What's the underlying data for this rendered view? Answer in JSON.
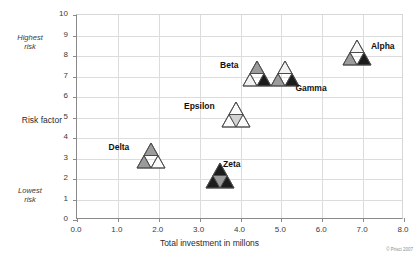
{
  "chart_data": {
    "type": "scatter",
    "title": "",
    "xlabel": "Total investment in millons",
    "ylabel": "Risk factor",
    "xlim": [
      0,
      8
    ],
    "ylim": [
      0,
      10
    ],
    "grid": true,
    "legend": "none",
    "x_ticks": [
      "0.0",
      "1.0",
      "2.0",
      "3.0",
      "4.0",
      "5.0",
      "6.0",
      "7.0",
      "8.0"
    ],
    "y_ticks": [
      "0",
      "1",
      "2",
      "3",
      "4",
      "5",
      "6",
      "7",
      "8",
      "9",
      "10"
    ],
    "y_annotations": {
      "high_line1": "Highest",
      "high_line2": "risk",
      "low_line1": "Lowest",
      "low_line2": "risk"
    },
    "points": [
      {
        "name": "Alpha",
        "x": 6.85,
        "y": 8.0,
        "label_side": "right",
        "shades": {
          "top": "#f6f6f6",
          "left": "#9b9b9b",
          "right": "#1c1c1c"
        }
      },
      {
        "name": "Beta",
        "x": 4.4,
        "y": 7.0,
        "label_side": "left",
        "shades": {
          "top": "#9b9b9b",
          "left": "#f2f2f2",
          "right": "#1c1c1c"
        }
      },
      {
        "name": "Gamma",
        "x": 5.1,
        "y": 7.0,
        "label_side": "rightlow",
        "shades": {
          "top": "#f2f2f2",
          "left": "#9b9b9b",
          "right": "#1c1c1c"
        }
      },
      {
        "name": "Epsilon",
        "x": 3.9,
        "y": 5.0,
        "label_side": "left",
        "shades": {
          "top": "#fbfbfb",
          "left": "#fbfbfb",
          "right": "#fbfbfb",
          "center": "#d2d2d2"
        }
      },
      {
        "name": "Delta",
        "x": 1.8,
        "y": 3.0,
        "label_side": "left",
        "shades": {
          "top": "#9b9b9b",
          "left": "#9b9b9b",
          "right": "#fbfbfb"
        }
      },
      {
        "name": "Zeta",
        "x": 3.5,
        "y": 2.0,
        "label_side": "rightup",
        "shades": {
          "top": "#1c1c1c",
          "left": "#1c1c1c",
          "right": "#1c1c1c",
          "center": "#9b9b9b"
        }
      }
    ],
    "credit": "© Prisci 2007"
  },
  "colors": {
    "axis": "#8a8a8a",
    "grid": "#dcdcdc",
    "text": "#2b2b2b",
    "dark": "#1c1c1c",
    "mid": "#9b9b9b",
    "light": "#f4f4f4"
  }
}
